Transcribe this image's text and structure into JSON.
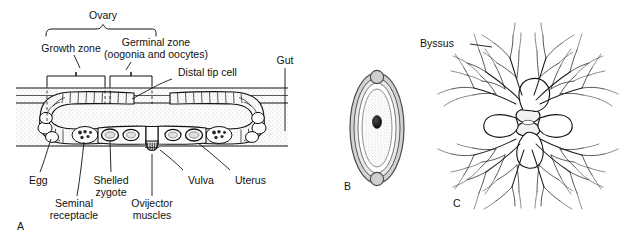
{
  "figure": {
    "background_color": "#ffffff",
    "ink_color": "#111111",
    "body_fill_color": "#e4e4e4",
    "panels": [
      {
        "id": "A",
        "label": "A",
        "caption": "Nematode hermaphrodite reproductive system, lateral view"
      },
      {
        "id": "B",
        "label": "B",
        "caption": "Shelled egg with nucleus"
      },
      {
        "id": "C",
        "label": "C",
        "caption": "Branching byssus attachment structure"
      }
    ]
  },
  "panel_a": {
    "label": "A",
    "labels": {
      "ovary": "Ovary",
      "growth_zone": "Growth zone",
      "germinal_zone_line1": "Germinal zone",
      "germinal_zone_line2": "(oogonia and oocytes)",
      "distal_tip_cell": "Distal tip cell",
      "gut": "Gut",
      "egg": "Egg",
      "shelled_zygote_line1": "Shelled",
      "shelled_zygote_line2": "zygote",
      "seminal_receptacle_line1": "Seminal",
      "seminal_receptacle_line2": "receptacle",
      "ovijector_line1": "Ovijector",
      "ovijector_line2": "muscles",
      "vulva": "Vulva",
      "uterus": "Uterus"
    }
  },
  "panel_b": {
    "label": "B",
    "structures": [
      "eggshell",
      "vitelline layer",
      "cytoplasm",
      "nucleus",
      "polar knob"
    ]
  },
  "panel_c": {
    "label": "C",
    "labels": {
      "byssus": "Byssus"
    },
    "structures": [
      "central spool",
      "lobes",
      "branching filaments"
    ]
  }
}
